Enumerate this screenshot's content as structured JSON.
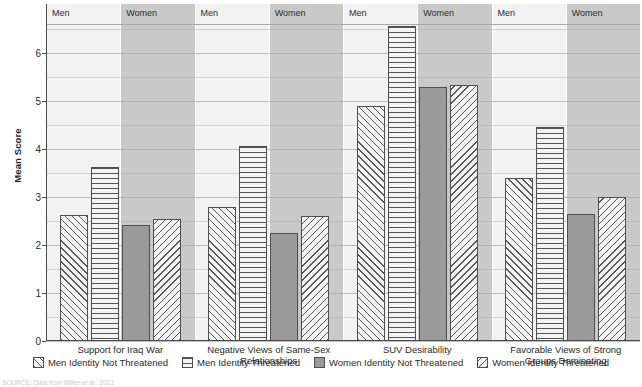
{
  "chart_data": {
    "type": "bar",
    "title": "",
    "xlabel": "",
    "ylabel": "Mean Score",
    "ylim": [
      0,
      6.6
    ],
    "yticks": [
      0,
      1,
      2,
      3,
      4,
      5,
      6
    ],
    "ytick_labels": [
      "0",
      "1",
      "2",
      "3",
      "4",
      "5",
      "6"
    ],
    "grid": true,
    "grid_step": 0.5,
    "legend_position": "bottom",
    "categories": [
      "Support for Iraq War",
      "Negative Views of Same-Sex Relationships",
      "SUV Desirability",
      "Favorable Views of Strong Groups Dominating"
    ],
    "gender_bands": [
      "Men",
      "Women",
      "Men",
      "Women",
      "Men",
      "Women",
      "Men",
      "Women"
    ],
    "series": [
      {
        "name": "Men Identity Not Threatened",
        "pattern": "diagonal-up",
        "values": [
          2.62,
          2.8,
          4.9,
          3.4
        ]
      },
      {
        "name": "Men Identity Threatened",
        "pattern": "horizontal-lines",
        "values": [
          3.62,
          4.05,
          6.55,
          4.45
        ]
      },
      {
        "name": "Women Identity Not Threatened",
        "pattern": "solid-gray",
        "values": [
          2.42,
          2.25,
          5.28,
          2.65
        ]
      },
      {
        "name": "Women Identity Threatened",
        "pattern": "diagonal-down",
        "values": [
          2.53,
          2.6,
          5.32,
          3.0
        ]
      }
    ]
  },
  "axis": {
    "y_title": "Mean Score"
  },
  "category_labels": [
    {
      "line1": "Support for Iraq War",
      "line2": ""
    },
    {
      "line1": "Negative Views of Same-Sex Relationships",
      "line2": ""
    },
    {
      "line1": "SUV Desirability",
      "line2": ""
    },
    {
      "line1": "Favorable Views of Strong",
      "line2": "Groups Dominating"
    }
  ],
  "bands": [
    {
      "label": "Men"
    },
    {
      "label": "Women"
    },
    {
      "label": "Men"
    },
    {
      "label": "Women"
    },
    {
      "label": "Men"
    },
    {
      "label": "Women"
    },
    {
      "label": "Men"
    },
    {
      "label": "Women"
    }
  ],
  "legend": [
    {
      "label": "Men Identity Not Threatened",
      "pattern": "diagonal-up"
    },
    {
      "label": "Men Identity Threatened",
      "pattern": "horizontal-lines"
    },
    {
      "label": "Women Identity Not Threatened",
      "pattern": "solid-gray"
    },
    {
      "label": "Women Identity Threatened",
      "pattern": "diagonal-down"
    }
  ],
  "source_note": "SOURCE: Data from Willer et al., 2013",
  "colors": {
    "band_light": "#f2f2f2",
    "band_dark": "#c9c9c9",
    "bar_fill": "#f4f4f4",
    "bar_solid": "#9a9a9a",
    "bar_stroke": "#4f4f4f",
    "gridline": "#a9a9a9",
    "axis": "#4a4a4a",
    "text": "#2b2b2b"
  }
}
